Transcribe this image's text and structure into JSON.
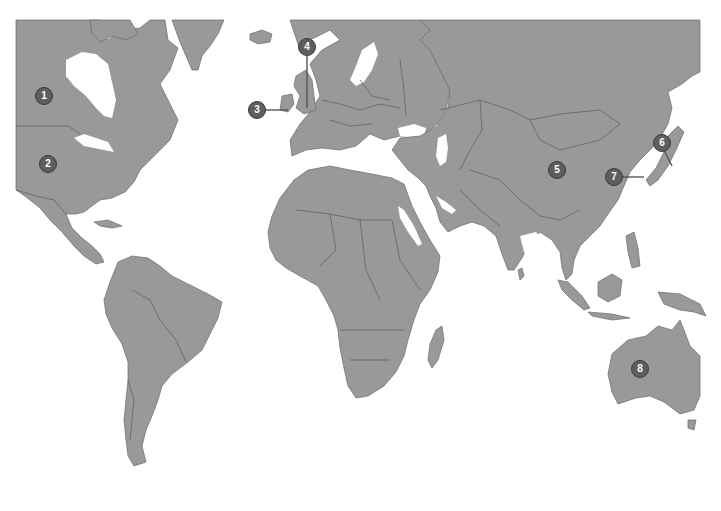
{
  "map": {
    "type": "world-political-map",
    "land_color": "#999999",
    "border_color": "#5a5a5a",
    "background_color": "#ffffff",
    "marker_color": "#5e5e5e",
    "markers": [
      {
        "label": "1",
        "x": 44,
        "y": 96,
        "region": "Canada"
      },
      {
        "label": "2",
        "x": 48,
        "y": 164,
        "region": "United States"
      },
      {
        "label": "3",
        "x": 257,
        "y": 110,
        "region": "Ireland"
      },
      {
        "label": "4",
        "x": 307,
        "y": 47,
        "region": "United Kingdom"
      },
      {
        "label": "5",
        "x": 557,
        "y": 170,
        "region": "China"
      },
      {
        "label": "6",
        "x": 662,
        "y": 143,
        "region": "Japan"
      },
      {
        "label": "7",
        "x": 614,
        "y": 177,
        "region": "South Korea"
      },
      {
        "label": "8",
        "x": 640,
        "y": 369,
        "region": "Australia"
      }
    ]
  }
}
